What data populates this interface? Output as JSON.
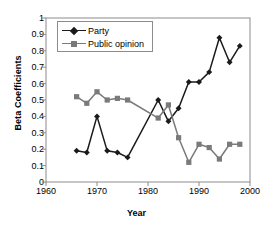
{
  "chart_data": {
    "type": "line",
    "title": "",
    "xlabel": "Year",
    "ylabel": "Beta Coefficients",
    "xlim": [
      1960,
      2000
    ],
    "ylim": [
      0,
      1
    ],
    "xticks": [
      1960,
      1970,
      1980,
      1990,
      2000
    ],
    "yticks": [
      "0",
      "0.1",
      "0.2",
      "0.3",
      "0.4",
      "0.5",
      "0.6",
      "0.7",
      "0.8",
      "0.9",
      "1"
    ],
    "grid": false,
    "legend_position": "upper-left",
    "x": [
      1966,
      1968,
      1970,
      1972,
      1974,
      1976,
      1978,
      1980,
      1982,
      1984,
      1986,
      1988,
      1990,
      1992,
      1994,
      1996,
      1998
    ],
    "series": [
      {
        "name": "Party",
        "color": "#1a1a1a",
        "marker": "diamond",
        "x": [
          1966,
          1968,
          1970,
          1972,
          1974,
          1976,
          1982,
          1984,
          1986,
          1988,
          1990,
          1992,
          1994,
          1996,
          1998
        ],
        "values": [
          0.19,
          0.18,
          0.4,
          0.19,
          0.18,
          0.15,
          0.5,
          0.37,
          0.45,
          0.61,
          0.61,
          0.67,
          0.88,
          0.73,
          0.83
        ]
      },
      {
        "name": "Public opinion",
        "color": "#7a7a7a",
        "marker": "square",
        "x": [
          1966,
          1968,
          1970,
          1972,
          1974,
          1976,
          1982,
          1984,
          1986,
          1988,
          1990,
          1992,
          1994,
          1996,
          1998
        ],
        "values": [
          0.52,
          0.48,
          0.55,
          0.5,
          0.51,
          0.5,
          0.39,
          0.47,
          0.27,
          0.12,
          0.23,
          0.21,
          0.14,
          0.23,
          0.23
        ]
      }
    ]
  },
  "legend": {
    "items": [
      {
        "label": "Party"
      },
      {
        "label": "Public opinion"
      }
    ]
  }
}
